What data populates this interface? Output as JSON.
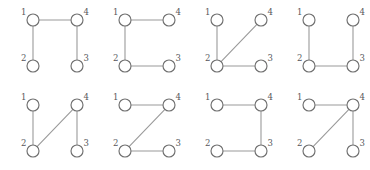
{
  "figure": {
    "name": "four-node-graph-gallery",
    "panel_count": 8,
    "columns": 4,
    "rows": 2,
    "node_count_per_panel": 4,
    "style": {
      "background": "#ffffff",
      "edge_color": "#9a9a9a",
      "node_stroke_color": "#6f6f6f",
      "node_fill_color": "#ffffff",
      "label_color": "#57575c",
      "node_radius": 6
    },
    "node_positions": {
      "1": {
        "x": 33,
        "y": 20,
        "label": "1",
        "label_side": "left"
      },
      "4": {
        "x": 77,
        "y": 20,
        "label": "4",
        "label_side": "right"
      },
      "2": {
        "x": 33,
        "y": 66,
        "label": "2",
        "label_side": "left"
      },
      "3": {
        "x": 77,
        "y": 66,
        "label": "3",
        "label_side": "right"
      }
    },
    "panels": [
      {
        "name": "panel-1",
        "origin": {
          "x": 0,
          "y": 0
        },
        "labels": {
          "1": "1",
          "2": "2",
          "3": "3",
          "4": "4"
        },
        "edges": [
          [
            "1",
            "4"
          ],
          [
            "1",
            "2"
          ],
          [
            "4",
            "3"
          ]
        ]
      },
      {
        "name": "panel-2",
        "origin": {
          "x": 92,
          "y": 0
        },
        "labels": {
          "1": "1",
          "2": "2",
          "3": "3",
          "4": "4"
        },
        "edges": [
          [
            "1",
            "4"
          ],
          [
            "1",
            "2"
          ],
          [
            "2",
            "3"
          ]
        ]
      },
      {
        "name": "panel-3",
        "origin": {
          "x": 184,
          "y": 0
        },
        "labels": {
          "1": "1",
          "2": "2",
          "3": "3",
          "4": "4"
        },
        "edges": [
          [
            "1",
            "2"
          ],
          [
            "2",
            "4"
          ],
          [
            "2",
            "3"
          ]
        ]
      },
      {
        "name": "panel-4",
        "origin": {
          "x": 276,
          "y": 0
        },
        "labels": {
          "1": "1",
          "2": "2",
          "3": "3",
          "4": "4"
        },
        "edges": [
          [
            "1",
            "2"
          ],
          [
            "2",
            "3"
          ],
          [
            "3",
            "4"
          ]
        ]
      },
      {
        "name": "panel-5",
        "origin": {
          "x": 0,
          "y": 85
        },
        "labels": {
          "1": "1",
          "2": "2",
          "3": "3",
          "4": "4"
        },
        "edges": [
          [
            "1",
            "2"
          ],
          [
            "2",
            "4"
          ],
          [
            "4",
            "3"
          ]
        ]
      },
      {
        "name": "panel-6",
        "origin": {
          "x": 92,
          "y": 85
        },
        "labels": {
          "1": "1",
          "2": "2",
          "3": "3",
          "4": "4"
        },
        "edges": [
          [
            "1",
            "4"
          ],
          [
            "4",
            "2"
          ],
          [
            "2",
            "3"
          ]
        ]
      },
      {
        "name": "panel-7",
        "origin": {
          "x": 184,
          "y": 85
        },
        "labels": {
          "1": "1",
          "2": "2",
          "3": "3",
          "4": "4"
        },
        "edges": [
          [
            "1",
            "4"
          ],
          [
            "4",
            "3"
          ],
          [
            "3",
            "2"
          ]
        ]
      },
      {
        "name": "panel-8",
        "origin": {
          "x": 276,
          "y": 85
        },
        "labels": {
          "1": "1",
          "2": "2",
          "3": "3",
          "4": "4"
        },
        "edges": [
          [
            "1",
            "4"
          ],
          [
            "4",
            "2"
          ],
          [
            "4",
            "3"
          ]
        ]
      }
    ]
  }
}
